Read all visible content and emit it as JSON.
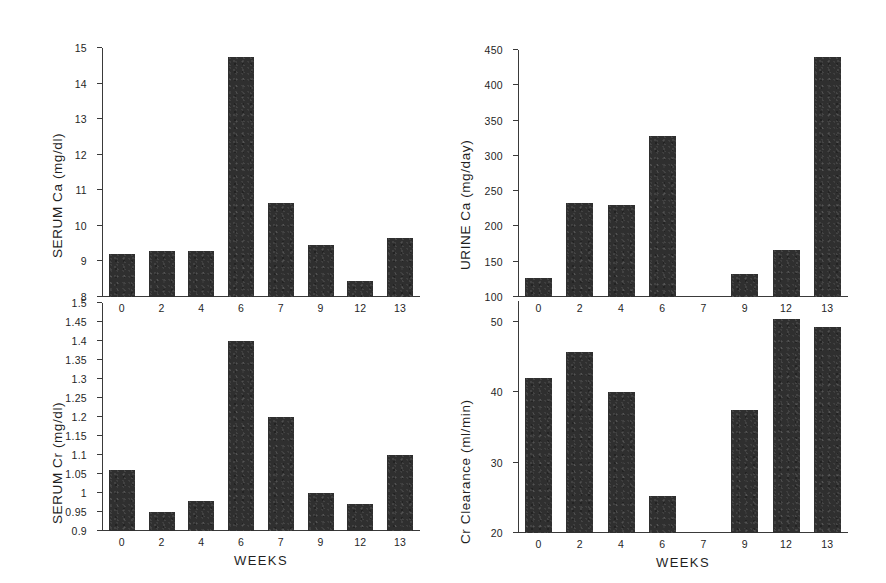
{
  "figure": {
    "background": "#ffffff",
    "bar_color": "#2f2f2f",
    "axis_color": "#3a3a3a"
  },
  "chart_data": [
    {
      "id": "serum-ca",
      "type": "bar",
      "title": "",
      "ylabel": "SERUM Ca  (mg/dl)",
      "xlabel": "",
      "categories": [
        "0",
        "2",
        "4",
        "6",
        "7",
        "9",
        "12",
        "13"
      ],
      "values": [
        9.2,
        9.3,
        9.3,
        14.75,
        10.65,
        9.45,
        8.45,
        9.65
      ],
      "ylim": [
        8,
        15
      ],
      "yticks": [
        8,
        9,
        10,
        11,
        12,
        13,
        14,
        15
      ],
      "ytick_labels": [
        "8",
        "9",
        "10",
        "11",
        "12",
        "13",
        "14",
        "15"
      ],
      "grid": false,
      "legend": "none"
    },
    {
      "id": "urine-ca",
      "type": "bar",
      "title": "",
      "ylabel": "URINE Ca  (mg/day)",
      "xlabel": "",
      "categories": [
        "0",
        "2",
        "4",
        "6",
        "7",
        "9",
        "12",
        "13"
      ],
      "values": [
        127,
        233,
        230,
        328,
        null,
        133,
        167,
        440
      ],
      "ylim": [
        100,
        450
      ],
      "yticks": [
        100,
        150,
        200,
        250,
        300,
        350,
        400,
        450
      ],
      "ytick_labels": [
        "100",
        "150",
        "200",
        "250",
        "300",
        "350",
        "400",
        "450"
      ],
      "grid": false,
      "legend": "none"
    },
    {
      "id": "serum-cr",
      "type": "bar",
      "title": "",
      "ylabel": "SERUM Cr  (mg/dl)",
      "xlabel": "WEEKS",
      "categories": [
        "0",
        "2",
        "4",
        "6",
        "7",
        "9",
        "12",
        "13"
      ],
      "values": [
        1.06,
        0.95,
        0.98,
        1.4,
        1.2,
        1.0,
        0.97,
        1.1
      ],
      "ylim": [
        0.9,
        1.5
      ],
      "yticks": [
        0.9,
        0.95,
        1.0,
        1.05,
        1.1,
        1.15,
        1.2,
        1.25,
        1.3,
        1.35,
        1.4,
        1.45,
        1.5
      ],
      "ytick_labels": [
        "0.9",
        "0.95",
        "1",
        "1.05",
        "1.1",
        "1.15",
        "1.2",
        "1.25",
        "1.3",
        "1.35",
        "1.4",
        "1.45",
        "1.5"
      ],
      "grid": false,
      "legend": "none"
    },
    {
      "id": "cr-clearance",
      "type": "bar",
      "title": "",
      "ylabel": "Cr Clearance  (ml/min)",
      "xlabel": "WEEKS",
      "categories": [
        "0",
        "2",
        "4",
        "6",
        "7",
        "9",
        "12",
        "13"
      ],
      "values": [
        42,
        45.7,
        40.1,
        25.2,
        null,
        37.5,
        50.4,
        49.3
      ],
      "ylim": [
        20,
        53
      ],
      "yticks": [
        20,
        30,
        40,
        50
      ],
      "ytick_labels": [
        "20",
        "30",
        "40",
        "50"
      ],
      "grid": false,
      "legend": "none"
    }
  ]
}
